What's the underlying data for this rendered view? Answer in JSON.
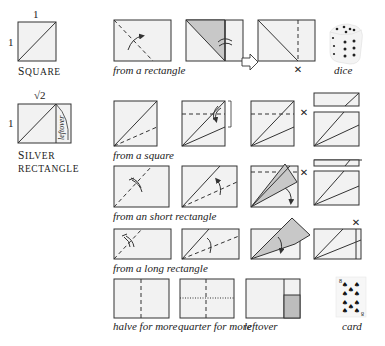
{
  "figure": {
    "type": "origami-folding-diagram",
    "paper_fill": "#f2f2f2",
    "shade_fill": "#c8c8c8",
    "stroke": "#333333"
  },
  "reference_shapes": {
    "square": {
      "side_top": "1",
      "side_left": "1",
      "label_first": "S",
      "label_rest": "quare"
    },
    "silver_rectangle": {
      "side_top": "√2",
      "side_left": "1",
      "leftover_label": "leftover",
      "label_line1_first": "S",
      "label_line1_rest": "ilver",
      "label_line2": "rectangle"
    }
  },
  "rows": [
    {
      "id": "from-rectangle",
      "caption": "from a rectangle",
      "extra_label": "dice"
    },
    {
      "id": "from-square",
      "caption": "from a square"
    },
    {
      "id": "from-short-rectangle",
      "caption": "from an short rectangle"
    },
    {
      "id": "from-long-rectangle",
      "caption": "from a long rectangle"
    },
    {
      "id": "bottom",
      "captions": [
        "halve for more",
        "quarter for more",
        "leftover"
      ],
      "extra_label": "card"
    }
  ],
  "cut_marks": {
    "glyph": "✕"
  },
  "card": {
    "rank": "8",
    "suit": "♠"
  }
}
